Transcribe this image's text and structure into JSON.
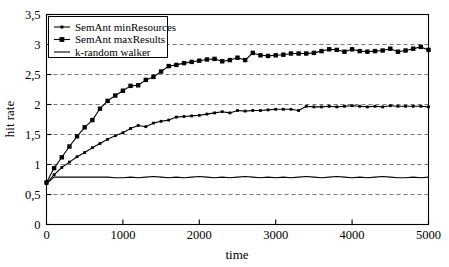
{
  "chart_data": {
    "type": "line",
    "title": "",
    "xlabel": "time",
    "ylabel": "hit rate",
    "xlim": [
      0,
      5000
    ],
    "ylim": [
      0,
      3.5
    ],
    "grid": true,
    "grid_axis": "y",
    "legend_position": "top-left",
    "decimal_separator": ",",
    "xticks": [
      0,
      1000,
      2000,
      3000,
      4000,
      5000
    ],
    "xtick_labels": [
      "0",
      "1000",
      "2000",
      "3000",
      "4000",
      "5000"
    ],
    "yticks": [
      0,
      0.5,
      1,
      1.5,
      2,
      2.5,
      3,
      3.5
    ],
    "ytick_labels": [
      "0",
      "0,5",
      "1",
      "1,5",
      "2",
      "2,5",
      "3",
      "3,5"
    ],
    "series": [
      {
        "name": "SemAnt minResources",
        "marker": "small-dot",
        "color": "#000000",
        "x": [
          0,
          100,
          200,
          300,
          400,
          500,
          600,
          700,
          800,
          900,
          1000,
          1100,
          1200,
          1300,
          1400,
          1500,
          1600,
          1700,
          1800,
          1900,
          2000,
          2100,
          2200,
          2300,
          2400,
          2500,
          2600,
          2700,
          2800,
          2900,
          3000,
          3100,
          3200,
          3300,
          3400,
          3500,
          3600,
          3700,
          3800,
          3900,
          4000,
          4100,
          4200,
          4300,
          4400,
          4500,
          4600,
          4700,
          4800,
          4900,
          5000
        ],
        "values": [
          0.68,
          0.83,
          0.95,
          1.04,
          1.13,
          1.2,
          1.28,
          1.35,
          1.42,
          1.48,
          1.53,
          1.6,
          1.65,
          1.63,
          1.69,
          1.72,
          1.74,
          1.79,
          1.8,
          1.81,
          1.82,
          1.84,
          1.86,
          1.88,
          1.86,
          1.9,
          1.89,
          1.9,
          1.9,
          1.91,
          1.92,
          1.92,
          1.92,
          1.9,
          1.97,
          1.96,
          1.96,
          1.97,
          1.96,
          1.97,
          1.98,
          1.97,
          1.96,
          1.97,
          1.96,
          1.98,
          1.97,
          1.97,
          1.97,
          1.97,
          1.96
        ]
      },
      {
        "name": "SemAnt maxResults",
        "marker": "square",
        "color": "#000000",
        "x": [
          0,
          100,
          200,
          300,
          400,
          500,
          600,
          700,
          800,
          900,
          1000,
          1100,
          1200,
          1300,
          1400,
          1500,
          1600,
          1700,
          1800,
          1900,
          2000,
          2100,
          2200,
          2300,
          2400,
          2500,
          2600,
          2700,
          2800,
          2900,
          3000,
          3100,
          3200,
          3300,
          3400,
          3500,
          3600,
          3700,
          3800,
          3900,
          4000,
          4100,
          4200,
          4300,
          4400,
          4500,
          4600,
          4700,
          4800,
          4900,
          5000
        ],
        "values": [
          0.7,
          0.94,
          1.12,
          1.3,
          1.47,
          1.62,
          1.74,
          1.93,
          2.06,
          2.15,
          2.23,
          2.31,
          2.32,
          2.41,
          2.46,
          2.55,
          2.64,
          2.66,
          2.69,
          2.71,
          2.73,
          2.75,
          2.76,
          2.72,
          2.74,
          2.78,
          2.74,
          2.86,
          2.82,
          2.81,
          2.82,
          2.83,
          2.85,
          2.85,
          2.85,
          2.86,
          2.89,
          2.92,
          2.91,
          2.88,
          2.92,
          2.89,
          2.88,
          2.89,
          2.9,
          2.93,
          2.88,
          2.9,
          2.93,
          2.96,
          2.91
        ]
      },
      {
        "name": "k-random walker",
        "marker": "none",
        "color": "#000000",
        "x": [
          0,
          100,
          200,
          300,
          400,
          500,
          600,
          700,
          800,
          900,
          1000,
          1100,
          1200,
          1300,
          1400,
          1500,
          1600,
          1700,
          1800,
          1900,
          2000,
          2100,
          2200,
          2300,
          2400,
          2500,
          2600,
          2700,
          2800,
          2900,
          3000,
          3100,
          3200,
          3300,
          3400,
          3500,
          3600,
          3700,
          3800,
          3900,
          4000,
          4100,
          4200,
          4300,
          4400,
          4500,
          4600,
          4700,
          4800,
          4900,
          5000
        ],
        "values": [
          0.68,
          0.79,
          0.79,
          0.79,
          0.79,
          0.79,
          0.79,
          0.79,
          0.79,
          0.78,
          0.78,
          0.79,
          0.78,
          0.79,
          0.8,
          0.79,
          0.78,
          0.79,
          0.78,
          0.79,
          0.8,
          0.79,
          0.78,
          0.79,
          0.78,
          0.79,
          0.8,
          0.79,
          0.78,
          0.79,
          0.78,
          0.79,
          0.78,
          0.79,
          0.8,
          0.79,
          0.78,
          0.79,
          0.8,
          0.79,
          0.78,
          0.79,
          0.78,
          0.79,
          0.8,
          0.79,
          0.78,
          0.78,
          0.79,
          0.78,
          0.79
        ]
      }
    ]
  },
  "legend": {
    "entries": [
      {
        "label": "SemAnt minResources"
      },
      {
        "label": "SemAnt maxResults"
      },
      {
        "label": "k-random walker"
      }
    ]
  },
  "axes": {
    "x_title": "time",
    "y_title": "hit rate"
  }
}
